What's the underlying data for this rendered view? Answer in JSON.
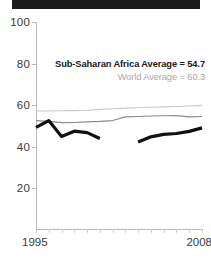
{
  "titlebar": {
    "present": true,
    "color": "#1b1b1b"
  },
  "legend": {
    "ssa_label": "Sub-Saharan Africa Average = 54.7",
    "world_label": "World Average = 60.3",
    "ssa_color": "#1a1a1a",
    "world_color": "#a8a8a8"
  },
  "axis": {
    "x_start_label": "1995",
    "x_end_label": "2008",
    "y_ticks": [
      "100",
      "80",
      "60",
      "40",
      "20"
    ]
  },
  "chart_data": {
    "type": "line",
    "title": "",
    "subtitle": "",
    "xlabel": "",
    "ylabel": "",
    "xlim": [
      1995,
      2008
    ],
    "ylim": [
      0,
      100
    ],
    "grid": false,
    "legend_position": "inside-top-right",
    "x": [
      1995,
      1996,
      1997,
      1998,
      1999,
      2000,
      2001,
      2002,
      2003,
      2004,
      2005,
      2006,
      2007,
      2008
    ],
    "y_tick_values": [
      20,
      40,
      60,
      80,
      100
    ],
    "x_tick_values": [
      1995,
      1996,
      1997,
      1998,
      1999,
      2000,
      2001,
      2002,
      2003,
      2004,
      2005,
      2006,
      2007,
      2008
    ],
    "annotations": [
      "Sub-Saharan Africa Average = 54.7",
      "World Average = 60.3"
    ],
    "series": [
      {
        "name": "Country",
        "color": "#111111",
        "width": 3.2,
        "style": "thick-black-with-gap",
        "values": [
          49.3,
          52.6,
          45.0,
          47.5,
          46.8,
          44.0,
          null,
          null,
          42.3,
          44.8,
          46.0,
          46.4,
          47.4,
          49.1
        ]
      },
      {
        "name": "Sub-Saharan Africa Average",
        "color": "#8a8a8a",
        "width": 1.1,
        "style": "thin-grey",
        "average": 54.7,
        "values": [
          52.6,
          52.2,
          51.6,
          51.7,
          52.0,
          52.2,
          52.6,
          54.4,
          54.6,
          54.8,
          54.9,
          55.0,
          54.4,
          54.6
        ]
      },
      {
        "name": "World Average",
        "color": "#c8c8c8",
        "width": 1.1,
        "style": "thin-light-grey",
        "average": 60.3,
        "values": [
          57.2,
          57.2,
          57.3,
          57.4,
          57.6,
          58.0,
          58.3,
          58.6,
          58.8,
          59.0,
          59.2,
          59.4,
          59.6,
          59.9
        ]
      }
    ]
  }
}
